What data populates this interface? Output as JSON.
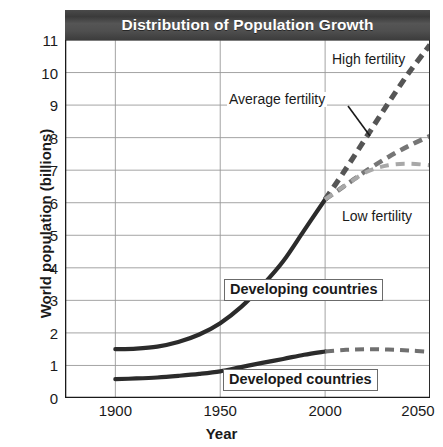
{
  "chart_data": {
    "type": "line",
    "title": "Distribution of Population Growth",
    "xlabel": "Year",
    "ylabel": "World population (billions)",
    "xlim": [
      1876,
      2050
    ],
    "ylim": [
      0,
      11
    ],
    "xticks": [
      1900,
      1950,
      2000,
      2050
    ],
    "yticks": [
      0,
      1,
      2,
      3,
      4,
      5,
      6,
      7,
      8,
      9,
      10,
      11
    ],
    "grid": true,
    "legend_position": "inline-annotations",
    "annotations": [
      {
        "name": "high-fertility",
        "text": "High fertility",
        "x": 2008,
        "y": 10.4
      },
      {
        "name": "average-fertility",
        "text": "Average fertility",
        "x": 1955,
        "y": 9.1
      },
      {
        "name": "low-fertility",
        "text": "Low fertility",
        "x": 2012,
        "y": 6.0
      },
      {
        "name": "developing-countries",
        "text": "Developing countries",
        "x": 1953,
        "y": 3.8
      },
      {
        "name": "developed-countries",
        "text": "Developed countries",
        "x": 1953,
        "y": 1.0
      }
    ],
    "series": [
      {
        "name": "Developing countries",
        "style": "solid",
        "color": "#2b2b2b",
        "x": [
          1900,
          1910,
          1920,
          1930,
          1940,
          1950,
          1960,
          1970,
          1980,
          1990,
          2000
        ],
        "values": [
          1.5,
          1.52,
          1.58,
          1.72,
          1.95,
          2.3,
          2.8,
          3.45,
          4.2,
          5.15,
          6.1
        ]
      },
      {
        "name": "High fertility",
        "style": "dashed",
        "color": "#555555",
        "x": [
          2000,
          2010,
          2020,
          2030,
          2040,
          2050
        ],
        "values": [
          6.1,
          7.05,
          8.05,
          9.05,
          10.0,
          10.85
        ]
      },
      {
        "name": "Average fertility",
        "style": "dashed",
        "color": "#767676",
        "x": [
          2000,
          2010,
          2020,
          2030,
          2040,
          2050
        ],
        "values": [
          6.1,
          6.55,
          7.0,
          7.4,
          7.75,
          8.05
        ]
      },
      {
        "name": "Low fertility",
        "style": "dashed",
        "color": "#a8a8a8",
        "x": [
          2000,
          2010,
          2020,
          2030,
          2040,
          2050
        ],
        "values": [
          6.1,
          6.55,
          6.95,
          7.15,
          7.2,
          7.15
        ]
      },
      {
        "name": "Developed countries",
        "style": "solid",
        "color": "#2b2b2b",
        "x": [
          1900,
          1910,
          1920,
          1930,
          1940,
          1950,
          1960,
          1970,
          1980,
          1990,
          2000
        ],
        "values": [
          0.58,
          0.6,
          0.63,
          0.68,
          0.74,
          0.82,
          0.95,
          1.08,
          1.2,
          1.33,
          1.43
        ]
      },
      {
        "name": "Developed countries projection",
        "style": "dashed",
        "color": "#707070",
        "x": [
          2000,
          2010,
          2020,
          2030,
          2040,
          2050
        ],
        "values": [
          1.43,
          1.48,
          1.5,
          1.49,
          1.46,
          1.42
        ]
      }
    ]
  },
  "ytick_labels": [
    "11",
    "10",
    "9",
    "8",
    "7",
    "6",
    "5",
    "4",
    "3",
    "2",
    "1",
    "0"
  ],
  "xtick_labels": [
    "1900",
    "1950",
    "2000",
    "2050"
  ]
}
